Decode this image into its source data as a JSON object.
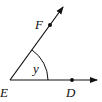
{
  "diagram": {
    "type": "angle",
    "vertex": {
      "label": "E",
      "x": 10,
      "y": 80
    },
    "rays": [
      {
        "name": "ED",
        "point_label": "D",
        "point": {
          "x": 72,
          "y": 80
        },
        "end": {
          "x": 97,
          "y": 80
        }
      },
      {
        "name": "EF",
        "point_label": "F",
        "point": {
          "x": 50,
          "y": 25
        },
        "end": {
          "x": 63,
          "y": 7
        }
      }
    ],
    "angle_label": "y",
    "colors": {
      "stroke": "#111111",
      "background": "#ffffff"
    }
  }
}
